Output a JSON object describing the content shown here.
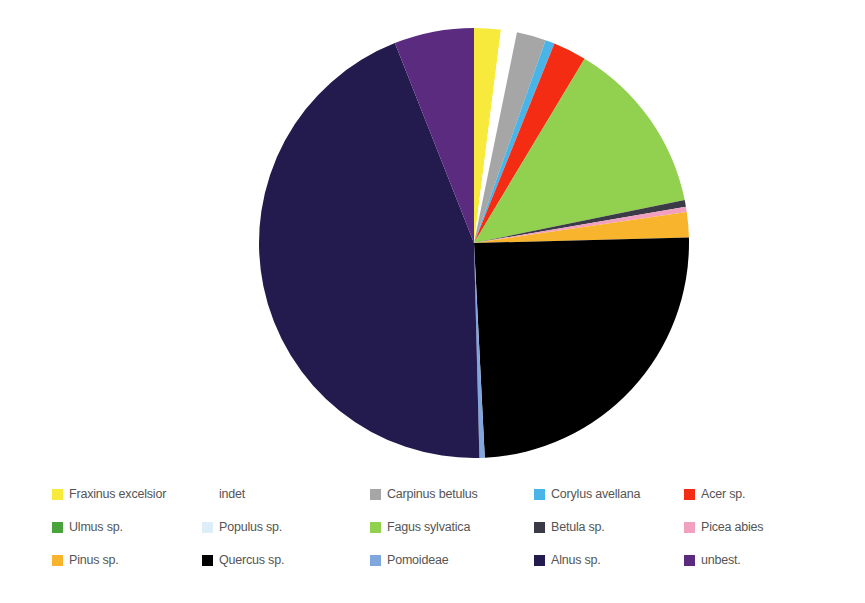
{
  "chart_data": {
    "type": "pie",
    "title": "",
    "subtitle": "",
    "xlabel": "",
    "ylabel": "",
    "legend_position": "bottom",
    "grid": false,
    "start_angle_deg": 0,
    "direction": "clockwise",
    "categories": [
      "Fraxinus excelsior",
      "indet",
      "Carpinus betulus",
      "Corylus avellana",
      "Acer sp.",
      "Fagus sylvatica",
      "Betula sp.",
      "Picea abies",
      "Pinus sp.",
      "Quercus sp.",
      "Pomoideae",
      "Alnus sp.",
      "unbest."
    ],
    "values": [
      2.0,
      1.2,
      2.2,
      0.7,
      2.5,
      13.2,
      0.5,
      0.4,
      1.9,
      24.6,
      0.4,
      44.4,
      6.0
    ],
    "colors": [
      "#f7ea3c",
      "#ffffff",
      "#a6a6a6",
      "#49b4e8",
      "#f42c14",
      "#92d050",
      "#3b3b47",
      "#f2a0c0",
      "#f7b42c",
      "#000000",
      "#7fa6dd",
      "#231a4e",
      "#5b2b80"
    ],
    "slices": [
      {
        "label": "Fraxinus excelsior",
        "value": 2.0,
        "color": "#f7ea3c"
      },
      {
        "label": "indet",
        "value": 1.2,
        "color": "#ffffff"
      },
      {
        "label": "Carpinus betulus",
        "value": 2.2,
        "color": "#a6a6a6"
      },
      {
        "label": "Corylus avellana",
        "value": 0.7,
        "color": "#49b4e8"
      },
      {
        "label": "Acer sp.",
        "value": 2.5,
        "color": "#f42c14"
      },
      {
        "label": "Fagus sylvatica",
        "value": 13.2,
        "color": "#92d050"
      },
      {
        "label": "Betula sp.",
        "value": 0.5,
        "color": "#3b3b47"
      },
      {
        "label": "Picea abies",
        "value": 0.4,
        "color": "#f2a0c0"
      },
      {
        "label": "Pinus sp.",
        "value": 1.9,
        "color": "#f7b42c"
      },
      {
        "label": "Quercus sp.",
        "value": 24.6,
        "color": "#000000"
      },
      {
        "label": "Pomoideae",
        "value": 0.4,
        "color": "#7fa6dd"
      },
      {
        "label": "Alnus sp.",
        "value": 44.4,
        "color": "#231a4e"
      },
      {
        "label": "unbest.",
        "value": 6.0,
        "color": "#5b2b80"
      }
    ]
  },
  "legend": {
    "rows": [
      [
        {
          "label": "Fraxinus excelsior",
          "color": "#f7ea3c",
          "name": "fraxinus-excelsior"
        },
        {
          "label": "indet",
          "color": "#ffffff",
          "name": "indet"
        },
        {
          "label": "Carpinus betulus",
          "color": "#a6a6a6",
          "name": "carpinus-betulus"
        },
        {
          "label": "Corylus avellana",
          "color": "#49b4e8",
          "name": "corylus-avellana"
        },
        {
          "label": "Acer sp.",
          "color": "#f42c14",
          "name": "acer-sp"
        }
      ],
      [
        {
          "label": "Ulmus sp.",
          "color": "#4aa23c",
          "name": "ulmus-sp"
        },
        {
          "label": "Populus sp.",
          "color": "#ddeef8",
          "name": "populus-sp"
        },
        {
          "label": "Fagus sylvatica",
          "color": "#92d050",
          "name": "fagus-sylvatica"
        },
        {
          "label": "Betula sp.",
          "color": "#3b3b47",
          "name": "betula-sp"
        },
        {
          "label": "Picea abies",
          "color": "#f2a0c0",
          "name": "picea-abies"
        }
      ],
      [
        {
          "label": "Pinus sp.",
          "color": "#f7b42c",
          "name": "pinus-sp"
        },
        {
          "label": "Quercus sp.",
          "color": "#000000",
          "name": "quercus-sp"
        },
        {
          "label": "Pomoideae",
          "color": "#7fa6dd",
          "name": "pomoideae"
        },
        {
          "label": "Alnus sp.",
          "color": "#231a4e",
          "name": "alnus-sp"
        },
        {
          "label": "unbest.",
          "color": "#5b2b80",
          "name": "unbest"
        }
      ]
    ]
  },
  "pie_geometry": {
    "center_x": 474,
    "center_y": 243,
    "radius": 215
  }
}
